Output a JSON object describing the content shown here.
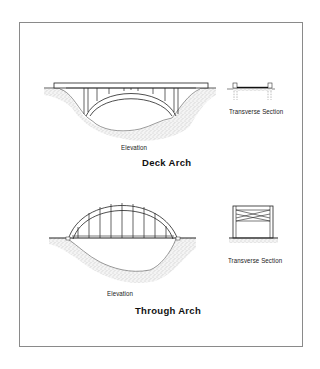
{
  "figure": {
    "sections": [
      {
        "title": "Deck Arch",
        "elevation_label": "Elevation",
        "section_label": "Transverse Section"
      },
      {
        "title": "Through Arch",
        "elevation_label": "Elevation",
        "section_label": "Transverse Section"
      }
    ]
  }
}
